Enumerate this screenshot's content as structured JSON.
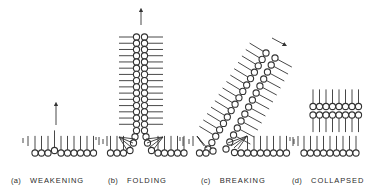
{
  "figure": {
    "ink_color": "#333333",
    "background": "#ffffff"
  },
  "panels": [
    {
      "id": "a",
      "tag": "(a)",
      "label": "WEAKENING",
      "label_x": 11
    },
    {
      "id": "b",
      "tag": "(b)",
      "label": "FOLDING",
      "label_x": 108
    },
    {
      "id": "c",
      "tag": "(c)",
      "label": "BREAKING",
      "label_x": 201
    },
    {
      "id": "d",
      "tag": "(d)",
      "label": "COLLAPSED",
      "label_x": 292
    }
  ],
  "geometry": {
    "r": 3.1,
    "baseline_y": 153,
    "tail_len": 14,
    "a": {
      "circles_x": [
        35,
        41.5,
        48,
        61,
        67.5,
        74,
        80.5,
        87,
        93.5
      ],
      "raised": {
        "x": 54.5,
        "y": 150.5
      },
      "edge_ticks": [
        {
          "x": 23,
          "y1": 138,
          "y2": 143
        },
        {
          "x": 28,
          "y1": 136,
          "y2": 146
        },
        {
          "x": 96,
          "y1": 137,
          "y2": 140
        },
        {
          "x": 99,
          "y1": 137,
          "y2": 145
        }
      ],
      "arrow": {
        "x": 56,
        "y1": 125,
        "y2": 104
      }
    },
    "b": {
      "col_left_x": 136.5,
      "col_right_x": 144.5,
      "col_top_y": 37,
      "col_bottom_y": 143,
      "count": 18,
      "tail_left_end": 119,
      "tail_right_end": 163,
      "base_left_x": [
        110.5,
        117,
        123.5
      ],
      "base_right_x": [
        158,
        164.5,
        171,
        177.5,
        184
      ],
      "edge_ticks": [
        {
          "x": 103,
          "y1": 139,
          "y2": 144
        },
        {
          "x": 107,
          "y1": 136,
          "y2": 146
        },
        {
          "x": 180,
          "y1": 137,
          "y2": 141
        },
        {
          "x": 183,
          "y1": 137,
          "y2": 146
        }
      ],
      "arrow": {
        "x": 141,
        "y1": 25,
        "y2": 10
      }
    },
    "c": {
      "left_col": {
        "x1": 208,
        "y1": 149,
        "x2": 266,
        "y2": 53,
        "count": 16
      },
      "right_col": {
        "x1": 226,
        "y1": 149,
        "x2": 275,
        "y2": 58,
        "count": 14
      },
      "base_left_x": [
        199.5,
        206
      ],
      "base_right_x": [
        241,
        247.5,
        254,
        260.5,
        267,
        273.5,
        280,
        286.5
      ],
      "edge_ticks": [
        {
          "x": 189,
          "y1": 139,
          "y2": 144
        },
        {
          "x": 193,
          "y1": 136,
          "y2": 146
        },
        {
          "x": 290,
          "y1": 137,
          "y2": 141
        },
        {
          "x": 293,
          "y1": 137,
          "y2": 146
        }
      ],
      "arrow": {
        "x1": 272,
        "y1": 38,
        "x2": 285,
        "y2": 45
      }
    },
    "d": {
      "top_row_y": 106.5,
      "bottom_row_y": 115,
      "bilayer_x": [
        313,
        319.5,
        326,
        332.5,
        339,
        345.5,
        352,
        358.5
      ],
      "base_x": [
        304,
        310.5,
        317,
        323.5,
        330,
        336.5,
        343,
        349.5,
        356
      ],
      "edge_ticks": [
        {
          "x": 294,
          "y1": 139,
          "y2": 144
        },
        {
          "x": 298,
          "y1": 136,
          "y2": 146
        }
      ]
    }
  }
}
